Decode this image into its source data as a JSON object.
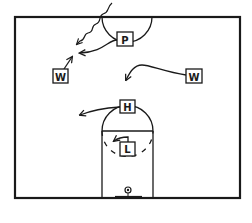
{
  "diagram": {
    "type": "basketball-play",
    "court": {
      "line_color": "#1a1a1a",
      "background": "#ffffff"
    },
    "players": [
      {
        "id": "P",
        "label": "P",
        "role": "point",
        "x": 125,
        "y": 39
      },
      {
        "id": "W1",
        "label": "W",
        "role": "wing-left",
        "x": 60,
        "y": 75
      },
      {
        "id": "W2",
        "label": "W",
        "role": "wing-right",
        "x": 194,
        "y": 75
      },
      {
        "id": "H",
        "label": "H",
        "role": "high-post",
        "x": 127,
        "y": 106
      },
      {
        "id": "L",
        "label": "L",
        "role": "low-post",
        "x": 127,
        "y": 148
      }
    ],
    "movements": [
      {
        "from": "P",
        "type": "pass",
        "description": "curved arrow toward left wing area"
      },
      {
        "from": "P",
        "type": "dribble",
        "description": "wavy line from top crossing half line toward left wing area"
      },
      {
        "from": "W1",
        "type": "cut",
        "description": "short arrow up-right"
      },
      {
        "from": "W2",
        "type": "cut",
        "description": "curved arrow toward middle"
      },
      {
        "from": "H",
        "type": "cut",
        "description": "arrow toward left"
      },
      {
        "from": "L",
        "type": "cut",
        "description": "short hooked arrow to left"
      }
    ]
  }
}
